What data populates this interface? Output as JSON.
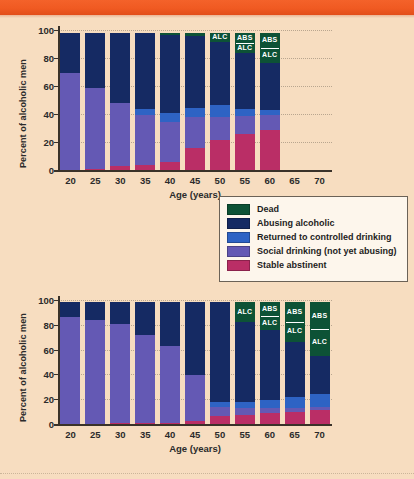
{
  "figure": {
    "background_color": "#f7ddc0",
    "header_bar_color": "#f0561f",
    "axis_color": "#3a3229",
    "grid_color": "#b9a68f"
  },
  "legend": {
    "name": "chart-legend",
    "items": [
      {
        "label": "Dead",
        "color": "#0d5236"
      },
      {
        "label": "Abusing alcoholic",
        "color": "#152a63"
      },
      {
        "label": "Returned to controlled drinking",
        "color": "#2e63c4"
      },
      {
        "label": "Social drinking (not yet abusing)",
        "color": "#6459b4"
      },
      {
        "label": "Stable abstinent",
        "color": "#ba2e66"
      }
    ]
  },
  "chart_data": [
    {
      "id": "top-chart",
      "type": "bar",
      "stacked": true,
      "title": "",
      "xlabel": "Age (years)",
      "ylabel": "Percent of alcoholic men",
      "ylim": [
        0,
        100
      ],
      "yticks": [
        0,
        20,
        40,
        60,
        80,
        100
      ],
      "xticks": [
        20,
        25,
        30,
        35,
        40,
        45,
        50,
        55,
        60,
        65,
        70
      ],
      "categories": [
        20,
        25,
        30,
        35,
        40,
        45,
        50,
        55,
        60
      ],
      "grid": "y-dotted",
      "legend_position": "below-right",
      "series": [
        {
          "name": "Stable abstinent",
          "color": "#ba2e66",
          "values": [
            0,
            1,
            3,
            4,
            6,
            16,
            22,
            26,
            29
          ]
        },
        {
          "name": "Social drinking (not yet abusing)",
          "color": "#6459b4",
          "values": [
            70,
            58,
            45,
            36,
            29,
            22,
            16,
            13,
            11
          ]
        },
        {
          "name": "Returned to controlled drinking",
          "color": "#2e63c4",
          "values": [
            0,
            0,
            0,
            4,
            6,
            7,
            9,
            5,
            3
          ]
        },
        {
          "name": "Abusing alcoholic",
          "color": "#152a63",
          "values": [
            28,
            39,
            50,
            54,
            56,
            51,
            45,
            40,
            34
          ]
        },
        {
          "name": "Dead",
          "color": "#0d5236",
          "values": [
            0,
            0,
            0,
            0,
            1,
            2,
            6,
            14,
            21
          ]
        }
      ],
      "annotations": [
        {
          "category": 50,
          "text": "ALC",
          "segment": "Dead"
        },
        {
          "category": 55,
          "text": "ABS",
          "segment": "Dead"
        },
        {
          "category": 55,
          "text": "ALC",
          "segment": "Dead"
        },
        {
          "category": 60,
          "text": "ABS",
          "segment": "Dead"
        },
        {
          "category": 60,
          "text": "ALC",
          "segment": "Dead"
        }
      ]
    },
    {
      "id": "bottom-chart",
      "type": "bar",
      "stacked": true,
      "title": "",
      "xlabel": "Age (years)",
      "ylabel": "Percent of alcoholic men",
      "ylim": [
        0,
        100
      ],
      "yticks": [
        0,
        20,
        40,
        60,
        80,
        100
      ],
      "xticks": [
        20,
        25,
        30,
        35,
        40,
        45,
        50,
        55,
        60,
        65,
        70
      ],
      "categories": [
        20,
        25,
        30,
        35,
        40,
        45,
        50,
        55,
        60,
        65,
        70
      ],
      "grid": "y-dotted",
      "legend_position": "shared",
      "series": [
        {
          "name": "Stable abstinent",
          "color": "#ba2e66",
          "values": [
            0,
            0,
            1,
            1,
            1,
            3,
            7,
            8,
            9,
            10,
            12
          ]
        },
        {
          "name": "Social drinking (not yet abusing)",
          "color": "#6459b4",
          "values": [
            87,
            84,
            80,
            71,
            62,
            37,
            7,
            5,
            4,
            3,
            2
          ]
        },
        {
          "name": "Returned to controlled drinking",
          "color": "#2e63c4",
          "values": [
            0,
            0,
            0,
            0,
            0,
            0,
            4,
            5,
            7,
            9,
            11
          ]
        },
        {
          "name": "Abusing alcoholic",
          "color": "#152a63",
          "values": [
            11,
            14,
            17,
            26,
            35,
            58,
            80,
            65,
            56,
            45,
            30
          ]
        },
        {
          "name": "Dead",
          "color": "#0d5236",
          "values": [
            0,
            0,
            0,
            0,
            0,
            0,
            0,
            15,
            22,
            31,
            43
          ]
        }
      ],
      "annotations": [
        {
          "category": 55,
          "text": "ALC",
          "segment": "Dead"
        },
        {
          "category": 60,
          "text": "ABS",
          "segment": "Dead"
        },
        {
          "category": 60,
          "text": "ALC",
          "segment": "Dead"
        },
        {
          "category": 65,
          "text": "ABS",
          "segment": "Dead"
        },
        {
          "category": 65,
          "text": "ALC",
          "segment": "Dead"
        },
        {
          "category": 70,
          "text": "ABS",
          "segment": "Dead"
        },
        {
          "category": 70,
          "text": "ALC",
          "segment": "Dead"
        }
      ]
    }
  ]
}
